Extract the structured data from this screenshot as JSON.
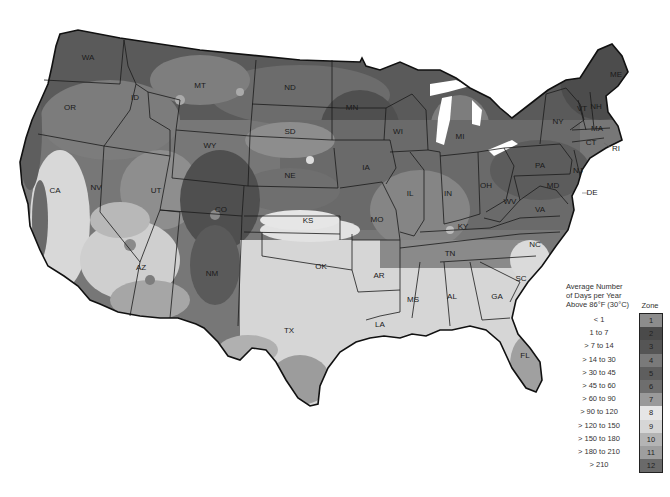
{
  "map": {
    "type": "choropleth",
    "subject": "Average Number of Days per Year Above 86°F (30°C)",
    "region": "Contiguous United States",
    "state_labels": [
      {
        "abbr": "WA",
        "x": 88,
        "y": 58
      },
      {
        "abbr": "OR",
        "x": 70,
        "y": 108
      },
      {
        "abbr": "ID",
        "x": 135,
        "y": 98
      },
      {
        "abbr": "MT",
        "x": 200,
        "y": 86
      },
      {
        "abbr": "WY",
        "x": 210,
        "y": 146
      },
      {
        "abbr": "ND",
        "x": 290,
        "y": 88
      },
      {
        "abbr": "SD",
        "x": 290,
        "y": 132
      },
      {
        "abbr": "NE",
        "x": 290,
        "y": 176
      },
      {
        "abbr": "MN",
        "x": 352,
        "y": 108
      },
      {
        "abbr": "WI",
        "x": 398,
        "y": 132
      },
      {
        "abbr": "IA",
        "x": 366,
        "y": 168
      },
      {
        "abbr": "MI",
        "x": 460,
        "y": 137
      },
      {
        "abbr": "IL",
        "x": 410,
        "y": 194
      },
      {
        "abbr": "IN",
        "x": 448,
        "y": 194
      },
      {
        "abbr": "OH",
        "x": 486,
        "y": 186
      },
      {
        "abbr": "NY",
        "x": 558,
        "y": 122
      },
      {
        "abbr": "PA",
        "x": 540,
        "y": 166
      },
      {
        "abbr": "VT",
        "x": 582,
        "y": 109
      },
      {
        "abbr": "NH",
        "x": 596,
        "y": 107
      },
      {
        "abbr": "ME",
        "x": 616,
        "y": 75
      },
      {
        "abbr": "MA",
        "x": 597,
        "y": 129
      },
      {
        "abbr": "CT",
        "x": 591,
        "y": 143
      },
      {
        "abbr": "RI",
        "x": 616,
        "y": 149
      },
      {
        "abbr": "NJ",
        "x": 578,
        "y": 171
      },
      {
        "abbr": "DE",
        "x": 592,
        "y": 193
      },
      {
        "abbr": "MD",
        "x": 553,
        "y": 186
      },
      {
        "abbr": "WV",
        "x": 510,
        "y": 202
      },
      {
        "abbr": "VA",
        "x": 540,
        "y": 210
      },
      {
        "abbr": "KY",
        "x": 463,
        "y": 227
      },
      {
        "abbr": "TN",
        "x": 450,
        "y": 254
      },
      {
        "abbr": "NC",
        "x": 535,
        "y": 245
      },
      {
        "abbr": "SC",
        "x": 521,
        "y": 279
      },
      {
        "abbr": "GA",
        "x": 497,
        "y": 297
      },
      {
        "abbr": "AL",
        "x": 452,
        "y": 297
      },
      {
        "abbr": "MS",
        "x": 413,
        "y": 300
      },
      {
        "abbr": "LA",
        "x": 380,
        "y": 325
      },
      {
        "abbr": "AR",
        "x": 379,
        "y": 276
      },
      {
        "abbr": "MO",
        "x": 377,
        "y": 220
      },
      {
        "abbr": "KS",
        "x": 308,
        "y": 221
      },
      {
        "abbr": "OK",
        "x": 321,
        "y": 267
      },
      {
        "abbr": "TX",
        "x": 289,
        "y": 331
      },
      {
        "abbr": "NM",
        "x": 212,
        "y": 274
      },
      {
        "abbr": "AZ",
        "x": 141,
        "y": 268
      },
      {
        "abbr": "CO",
        "x": 221,
        "y": 210
      },
      {
        "abbr": "UT",
        "x": 156,
        "y": 191
      },
      {
        "abbr": "NV",
        "x": 96,
        "y": 188
      },
      {
        "abbr": "CA",
        "x": 55,
        "y": 191
      },
      {
        "abbr": "FL",
        "x": 525,
        "y": 356
      }
    ]
  },
  "legend": {
    "title_lines": [
      "Average Number",
      "of Days per Year",
      "Above 86°F (30°C)"
    ],
    "zone_header": "Zone",
    "zones": [
      {
        "zone": "1",
        "range": "< 1",
        "color": "#8c8c8c"
      },
      {
        "zone": "2",
        "range": "1 to 7",
        "color": "#4a4a4a"
      },
      {
        "zone": "3",
        "range": "> 7 to 14",
        "color": "#555555"
      },
      {
        "zone": "4",
        "range": "> 14 to 30",
        "color": "#7a7a7a"
      },
      {
        "zone": "5",
        "range": "> 30 to 45",
        "color": "#5e5e5e"
      },
      {
        "zone": "6",
        "range": "> 45 to 60",
        "color": "#6e6e6e"
      },
      {
        "zone": "7",
        "range": "> 60 to 90",
        "color": "#9a9a9a"
      },
      {
        "zone": "8",
        "range": "> 90 to 120",
        "color": "#e6e6e6"
      },
      {
        "zone": "9",
        "range": "> 120 to 150",
        "color": "#d6d6d6"
      },
      {
        "zone": "10",
        "range": "> 150 to 180",
        "color": "#b4b4b4"
      },
      {
        "zone": "11",
        "range": "> 180 to 210",
        "color": "#9e9e9e"
      },
      {
        "zone": "12",
        "range": "> 210",
        "color": "#6a6a6a"
      }
    ]
  }
}
